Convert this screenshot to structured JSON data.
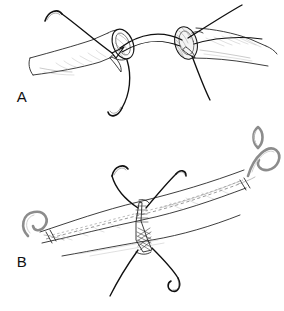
{
  "figure": {
    "background_color": "#ffffff",
    "ink_color": "#141414",
    "shading_color": "#8e8e8e",
    "width": 284,
    "height": 311,
    "style": "black-and-white line drawing, medical illustration"
  },
  "panels": [
    {
      "id": "A",
      "label": "A",
      "label_x": 22,
      "label_y": 102,
      "caption": "Two transected vessel ends held apart, with curved suture needles and threads passed through the cut edges",
      "elements": [
        {
          "name": "left-vessel-stump",
          "type": "vessel",
          "description": "Left transected vessel with open elliptical lumen facing right"
        },
        {
          "name": "right-vessel-stump",
          "type": "vessel",
          "description": "Right transected vessel with hatched cut rim facing left"
        },
        {
          "name": "bridging-suture",
          "type": "thread",
          "description": "Dark suture thread arcing between the two lumen edges"
        },
        {
          "name": "needle-upper-left",
          "type": "needle",
          "description": "Curved surgical needle at upper left with trailing thread"
        },
        {
          "name": "needle-lower-center",
          "type": "needle",
          "description": "Curved surgical needle hanging below the left stump"
        },
        {
          "name": "needle-upper-right",
          "type": "needle",
          "description": "Thread exiting to the upper right corner"
        },
        {
          "name": "needle-lower-right",
          "type": "needle",
          "description": "Thread descending from the right stump"
        },
        {
          "name": "clamp-tip-far-right",
          "type": "clamp",
          "description": "Small gray loop tip at far right"
        }
      ]
    },
    {
      "id": "B",
      "label": "B",
      "label_x": 22,
      "label_y": 267,
      "caption": "Completed anastomosis with the vessel ends approximated, running suture line visible and tied knot at the junction",
      "elements": [
        {
          "name": "anastomosed-vessel",
          "type": "vessel",
          "description": "Single continuous vessel arcing from lower left to upper right"
        },
        {
          "name": "suture-line",
          "type": "suture",
          "description": "Dashed running suture line along the vessel"
        },
        {
          "name": "knot-junction",
          "type": "knot",
          "description": "Cross-hatched tied knot at the anastomosis site"
        },
        {
          "name": "clamp-left",
          "type": "clamp",
          "description": "Gray curved vessel clamp hook at the left end"
        },
        {
          "name": "clamp-right",
          "type": "clamp",
          "description": "Gray curved vessel clamp hook at the upper right end"
        },
        {
          "name": "needle-upper-left",
          "type": "needle",
          "description": "Curved needle with thread above and left of the knot"
        },
        {
          "name": "needle-upper-right",
          "type": "needle",
          "description": "Curved needle with thread above and right of the knot"
        },
        {
          "name": "needle-lower-right",
          "type": "needle",
          "description": "Curved needle with thread below and right of the knot"
        },
        {
          "name": "thread-lower-left",
          "type": "thread",
          "description": "Suture tail descending to the lower left"
        }
      ]
    }
  ]
}
